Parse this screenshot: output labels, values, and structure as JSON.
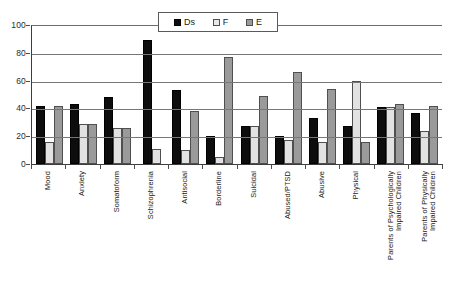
{
  "chart_data": {
    "type": "bar",
    "title": "",
    "subtitle": "",
    "xlabel": "",
    "ylabel": "",
    "ylim": [
      0,
      100
    ],
    "yticks": [
      0,
      20,
      40,
      60,
      80,
      100
    ],
    "grid": true,
    "legend_position": "top-center",
    "categories": [
      "Mood",
      "Anxiety",
      "Somatoform",
      "Schizophrenia",
      "Antisocial",
      "Borderline",
      "Suicidal",
      "Abused/PTSD",
      "Abusive",
      "Physical",
      "Parents of Psychologically Impaired Children",
      "Parents of Physically Impaired Children"
    ],
    "series": [
      {
        "name": "Ds",
        "color": "#0d0d0d",
        "values": [
          42,
          43,
          48,
          89,
          53,
          20,
          27,
          20,
          33,
          27,
          41,
          37
        ]
      },
      {
        "name": "F",
        "color": "#e2e2e2",
        "values": [
          16,
          29,
          26,
          11,
          10,
          5,
          27,
          17,
          16,
          60,
          41,
          24
        ]
      },
      {
        "name": "E",
        "color": "#9a9a9a",
        "values": [
          42,
          29,
          26,
          0,
          38,
          77,
          49,
          66,
          54,
          16,
          43,
          42
        ]
      }
    ]
  },
  "legend": {
    "items": [
      {
        "label": "Ds",
        "swatch": "ds"
      },
      {
        "label": "F",
        "swatch": "f"
      },
      {
        "label": "E",
        "swatch": "e"
      }
    ]
  },
  "axis": {
    "y_tick_labels": [
      "100",
      "80",
      "60",
      "40",
      "20",
      "0"
    ]
  }
}
